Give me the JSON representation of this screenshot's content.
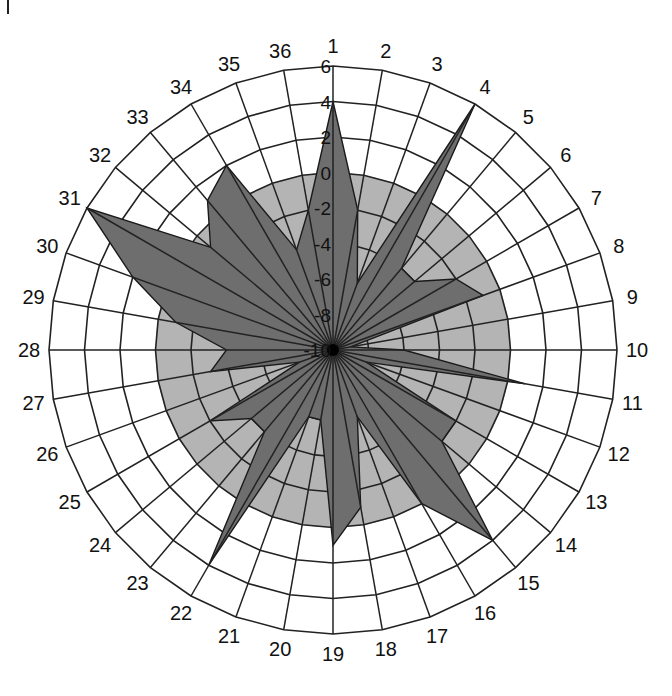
{
  "chart_data": {
    "type": "radar",
    "title": "",
    "categories": [
      "1",
      "2",
      "3",
      "4",
      "5",
      "6",
      "7",
      "8",
      "9",
      "10",
      "11",
      "12",
      "13",
      "14",
      "15",
      "16",
      "17",
      "18",
      "19",
      "20",
      "21",
      "22",
      "23",
      "24",
      "25",
      "26",
      "27",
      "28",
      "29",
      "30",
      "31",
      "32",
      "33",
      "34",
      "35",
      "36"
    ],
    "series": [
      {
        "name": "series",
        "values": [
          4,
          -2,
          -6,
          6,
          -4,
          -4,
          -2,
          -1,
          -9,
          -6,
          1,
          -8,
          -2,
          -2,
          4,
          0,
          -6,
          -1,
          1,
          -6,
          -6,
          4,
          -4,
          -4,
          -2,
          -8,
          -3,
          -4,
          -1,
          2,
          6,
          -1,
          1,
          2,
          -4,
          -2
        ]
      }
    ],
    "radial_ticks": [
      "-10",
      "-8",
      "-6",
      "-4",
      "-2",
      "0",
      "2",
      "4",
      "6"
    ],
    "rlim": [
      -10,
      6
    ],
    "reference_disc_value": 0,
    "grid": true,
    "legend": "none",
    "direction": "clockwise from top"
  },
  "colors": {
    "polygon_fill": "#6e6e6e",
    "reference_disc": "#b4b4b4",
    "background": "#ffffff",
    "grid": "#222222"
  }
}
